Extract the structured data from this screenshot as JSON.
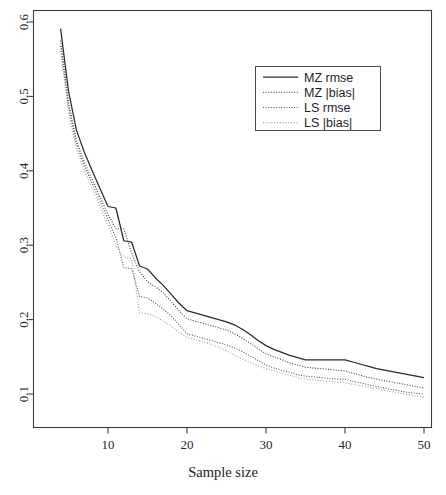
{
  "chart_data": {
    "type": "line",
    "title": "",
    "xlabel": "Sample size",
    "ylabel": "",
    "xlim": [
      3,
      51
    ],
    "ylim": [
      0.06,
      0.615
    ],
    "grid": false,
    "legend_position": "top-right",
    "x_ticks": [
      10,
      20,
      30,
      40,
      50
    ],
    "x_tick_labels": [
      "10",
      "20",
      "30",
      "40",
      "50"
    ],
    "y_ticks": [
      0.1,
      0.2,
      0.3,
      0.4,
      0.5,
      0.6
    ],
    "y_tick_labels": [
      "0.1",
      "0.2",
      "0.3",
      "0.4",
      "0.5",
      "0.6"
    ],
    "x": [
      4,
      5,
      6,
      7,
      8,
      9,
      10,
      11,
      12,
      13,
      14,
      15,
      16,
      17,
      18,
      19,
      20,
      21,
      22,
      23,
      24,
      25,
      26,
      27,
      28,
      29,
      30,
      31,
      32,
      33,
      34,
      35,
      36,
      37,
      38,
      39,
      40,
      41,
      42,
      43,
      44,
      45,
      46,
      47,
      48,
      49,
      50
    ],
    "series": [
      {
        "name": "MZ rmse",
        "style": "solid",
        "color": "#2b2b2b",
        "values": [
          0.591,
          0.507,
          0.455,
          0.425,
          0.4,
          0.376,
          0.352,
          0.35,
          0.306,
          0.304,
          0.272,
          0.268,
          0.256,
          0.246,
          0.234,
          0.222,
          0.212,
          0.209,
          0.206,
          0.203,
          0.2,
          0.197,
          0.193,
          0.187,
          0.18,
          0.172,
          0.165,
          0.16,
          0.156,
          0.152,
          0.149,
          0.146,
          0.146,
          0.146,
          0.146,
          0.146,
          0.146,
          0.143,
          0.14,
          0.137,
          0.134,
          0.132,
          0.13,
          0.128,
          0.126,
          0.124,
          0.122
        ]
      },
      {
        "name": "MZ |bias|",
        "style": "dotted",
        "color": "#3a3a3a",
        "values": [
          0.575,
          0.492,
          0.441,
          0.412,
          0.388,
          0.365,
          0.341,
          0.322,
          0.322,
          0.289,
          0.264,
          0.251,
          0.244,
          0.236,
          0.224,
          0.212,
          0.201,
          0.198,
          0.195,
          0.192,
          0.189,
          0.186,
          0.181,
          0.175,
          0.168,
          0.161,
          0.154,
          0.15,
          0.146,
          0.142,
          0.139,
          0.136,
          0.135,
          0.134,
          0.133,
          0.132,
          0.131,
          0.128,
          0.125,
          0.122,
          0.12,
          0.118,
          0.116,
          0.114,
          0.112,
          0.11,
          0.108
        ]
      },
      {
        "name": "LS rmse",
        "style": "dotted",
        "color": "#4f4f4f",
        "values": [
          0.568,
          0.486,
          0.436,
          0.407,
          0.383,
          0.359,
          0.334,
          0.31,
          0.27,
          0.268,
          0.231,
          0.229,
          0.222,
          0.214,
          0.205,
          0.193,
          0.181,
          0.178,
          0.175,
          0.172,
          0.169,
          0.166,
          0.162,
          0.157,
          0.151,
          0.145,
          0.139,
          0.135,
          0.132,
          0.129,
          0.126,
          0.124,
          0.123,
          0.122,
          0.121,
          0.12,
          0.12,
          0.117,
          0.115,
          0.112,
          0.11,
          0.108,
          0.106,
          0.104,
          0.102,
          0.101,
          0.1
        ]
      },
      {
        "name": "LS |bias|",
        "style": "dashdot",
        "color": "#9a9a9a",
        "values": [
          0.561,
          0.479,
          0.429,
          0.401,
          0.377,
          0.352,
          0.326,
          0.3,
          0.284,
          0.282,
          0.209,
          0.208,
          0.204,
          0.198,
          0.191,
          0.183,
          0.176,
          0.173,
          0.17,
          0.167,
          0.163,
          0.158,
          0.152,
          0.147,
          0.142,
          0.138,
          0.134,
          0.131,
          0.128,
          0.125,
          0.122,
          0.12,
          0.119,
          0.118,
          0.117,
          0.116,
          0.115,
          0.113,
          0.111,
          0.109,
          0.107,
          0.105,
          0.103,
          0.101,
          0.099,
          0.097,
          0.096
        ]
      }
    ]
  },
  "legend": {
    "entries": [
      {
        "label": "MZ  rmse"
      },
      {
        "label": "MZ |bias|"
      },
      {
        "label": "LS  rmse"
      },
      {
        "label": "LS |bias|"
      }
    ]
  },
  "axes": {
    "x_title": "Sample size"
  }
}
